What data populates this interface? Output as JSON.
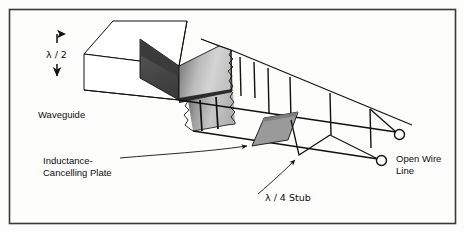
{
  "figure": {
    "kind": "technical-line-diagram",
    "background_color": "#fdfdfc",
    "border_color": "#3a3a3a",
    "line_color": "#111111"
  },
  "labels": {
    "waveguide": "Waveguide",
    "half_wavelength": "λ / 2",
    "inductance_plate_line1": "Inductance-",
    "inductance_plate_line2": "Cancelling Plate",
    "quarter_wave_stub": "λ / 4  Stub",
    "open_wire_line1": "Open Wire",
    "open_wire_line2": "Line"
  },
  "shading": {
    "dark_face": "#4a4a4a",
    "darkest_face": "#3b3b3b",
    "plate_gray": "#9a9a9a",
    "gradient_light": "#d8d8d8",
    "gradient_mid": "#a8a8a8",
    "gradient_dark": "#6e6e6e",
    "white_face": "#ffffff"
  },
  "annotations": {
    "terminal_count": 2,
    "strut_count": 6,
    "dimension_arrow": "double-headed-vertical"
  }
}
